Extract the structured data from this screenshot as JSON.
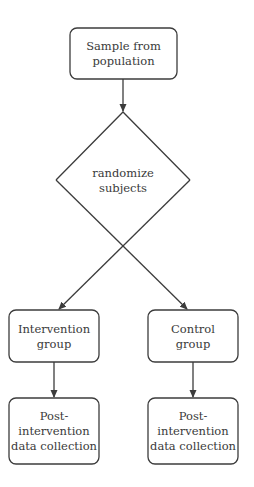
{
  "diagram": {
    "type": "flowchart",
    "nodes": [
      {
        "id": "sample",
        "shape": "rounded-rect",
        "lines": [
          "Sample from",
          "population"
        ]
      },
      {
        "id": "randomize",
        "shape": "diamond",
        "lines": [
          "randomize",
          "subjects"
        ]
      },
      {
        "id": "intervention",
        "shape": "rounded-rect",
        "lines": [
          "Intervention",
          "group"
        ]
      },
      {
        "id": "control",
        "shape": "rounded-rect",
        "lines": [
          "Control",
          "group"
        ]
      },
      {
        "id": "post-intervention",
        "shape": "rounded-rect",
        "lines": [
          "Post-",
          "intervention",
          "data collection"
        ]
      },
      {
        "id": "post-control",
        "shape": "rounded-rect",
        "lines": [
          "Post-",
          "intervention",
          "data collection"
        ]
      }
    ],
    "edges": [
      {
        "from": "sample",
        "to": "randomize"
      },
      {
        "from": "randomize",
        "to": "intervention"
      },
      {
        "from": "randomize",
        "to": "control"
      },
      {
        "from": "intervention",
        "to": "post-intervention"
      },
      {
        "from": "control",
        "to": "post-control"
      }
    ],
    "colors": {
      "stroke": "#3c3c3c",
      "text": "#3a3a3a",
      "background": "#ffffff"
    }
  }
}
